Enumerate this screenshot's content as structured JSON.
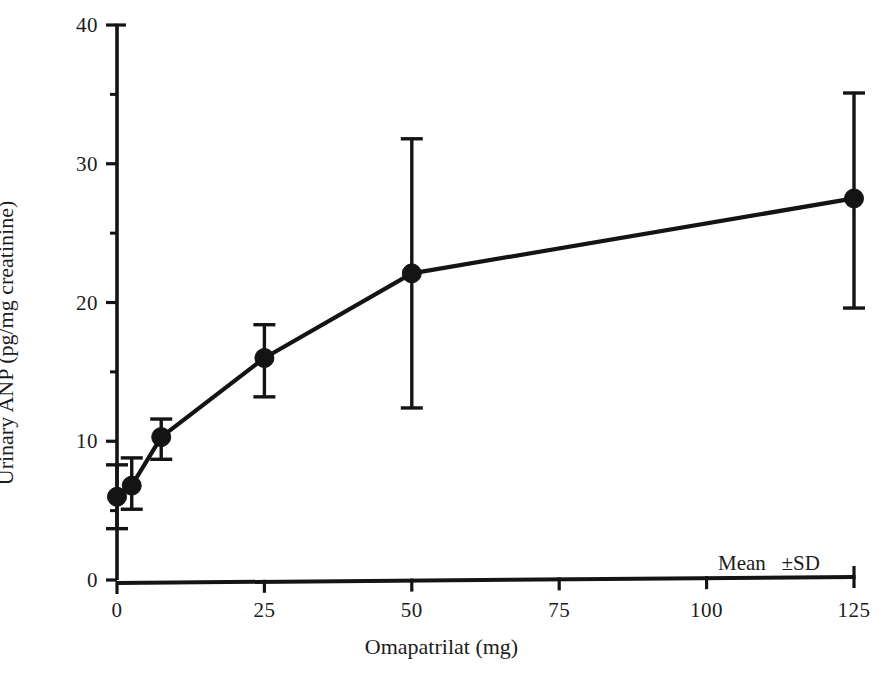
{
  "chart_data": {
    "type": "line",
    "title": "",
    "subtitle": "",
    "xlabel": "Omapatrilat (mg)",
    "ylabel": "Urinary ANP (pg/mg creatinine)",
    "xlim": [
      0,
      125
    ],
    "ylim": [
      0,
      40
    ],
    "xticks": [
      0,
      25,
      50,
      75,
      100,
      125
    ],
    "xticklabels": [
      "0",
      "25",
      "50",
      "75",
      "100",
      "125"
    ],
    "yticks": [
      0,
      10,
      20,
      30,
      40
    ],
    "yticklabels": [
      "0",
      "10",
      "20",
      "30",
      "40"
    ],
    "grid": false,
    "legend": false,
    "legend_position": "none",
    "annotations": [
      {
        "name": "mean-sd-note",
        "text": "Mean   ±SD",
        "x": 104,
        "y": 3.9
      }
    ],
    "series": [
      {
        "name": "Urinary ANP",
        "marker": "filled-circle",
        "color": "#141414",
        "x": [
          0,
          2.5,
          7.5,
          25,
          50,
          125
        ],
        "values": [
          6.0,
          6.8,
          10.3,
          16.0,
          22.1,
          27.5
        ],
        "error_up": [
          2.3,
          2.0,
          1.3,
          2.4,
          9.7,
          7.6
        ],
        "error_down": [
          2.3,
          1.7,
          1.6,
          2.8,
          9.7,
          7.9
        ],
        "error_top": [
          8.3,
          8.8,
          11.6,
          18.4,
          31.8,
          35.1
        ],
        "error_bottom": [
          3.7,
          5.1,
          8.7,
          13.2,
          12.4,
          19.6
        ]
      }
    ]
  }
}
